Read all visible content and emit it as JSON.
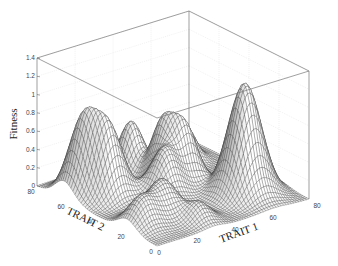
{
  "chart_data": {
    "type": "surface3d",
    "title": "",
    "xlabel": "TRAIT 1",
    "ylabel": "TRAIT 2",
    "zlabel": "Fitness",
    "xlim": [
      0,
      80
    ],
    "ylim": [
      0,
      80
    ],
    "zlim": [
      0,
      1.4
    ],
    "xticks": [
      "0",
      "20",
      "40",
      "60",
      "80"
    ],
    "yticks": [
      "0",
      "20",
      "40",
      "60",
      "80"
    ],
    "zticks": [
      "0",
      "0.2",
      "0.4",
      "0.6",
      "0.8",
      "1",
      "1.2",
      "1.4"
    ],
    "grid": true,
    "mesh_resolution": 60,
    "peaks": [
      {
        "x": 62,
        "y": 20,
        "height": 1.22,
        "sigma": 7
      },
      {
        "x": 10,
        "y": 62,
        "height": 0.8,
        "sigma": 6
      },
      {
        "x": 16,
        "y": 52,
        "height": 0.72,
        "sigma": 6
      },
      {
        "x": 40,
        "y": 68,
        "height": 0.55,
        "sigma": 5
      },
      {
        "x": 44,
        "y": 52,
        "height": 0.62,
        "sigma": 5
      },
      {
        "x": 50,
        "y": 44,
        "height": 0.58,
        "sigma": 5
      },
      {
        "x": 36,
        "y": 40,
        "height": 0.5,
        "sigma": 6
      },
      {
        "x": 22,
        "y": 24,
        "height": 0.38,
        "sigma": 6
      },
      {
        "x": 8,
        "y": 20,
        "height": 0.32,
        "sigma": 6
      },
      {
        "x": 66,
        "y": 64,
        "height": 0.35,
        "sigma": 4
      },
      {
        "x": 30,
        "y": 10,
        "height": 0.2,
        "sigma": 5
      }
    ]
  }
}
